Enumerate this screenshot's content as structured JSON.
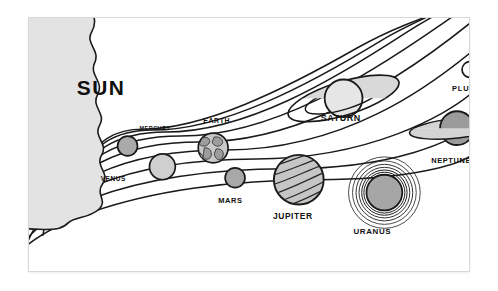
{
  "diagram": {
    "type": "schematic-illustration",
    "style": "black-and-white line art, coloring-book style",
    "frame": {
      "border_color": "#d8d8d8",
      "background_color": "#ffffff",
      "x": 28,
      "y": 17,
      "width": 442,
      "height": 255
    },
    "sun": {
      "label": "SUN",
      "fill_color": "#e3e3e3",
      "outline_color": "#1a1a1a",
      "description": "large partial sun at the left edge with flame-like wavy corona boundary",
      "label_x": 48,
      "label_y": 78,
      "label_font_size": 21
    },
    "orbit_count": 9,
    "orbit_color": "#1a1a1a",
    "bodies": [
      {
        "name": "MERCURY",
        "label": "MERCURY",
        "order": 1,
        "cx": 99,
        "cy": 129,
        "r": 10,
        "fill": "#aaaaaa",
        "label_x": 112,
        "label_y": 113,
        "label_size": 5.5,
        "rings": "none",
        "texture": "plain"
      },
      {
        "name": "VENUS",
        "label": "VENUS",
        "order": 2,
        "cx": 134,
        "cy": 150,
        "r": 13,
        "fill": "#cfcfcf",
        "label_x": 73,
        "label_y": 163,
        "label_size": 6.5,
        "rings": "none",
        "texture": "plain"
      },
      {
        "name": "EARTH",
        "label": "EARTH",
        "order": 3,
        "cx": 185,
        "cy": 131,
        "r": 15,
        "fill": "#c9c9c9",
        "label_x": 176,
        "label_y": 106,
        "label_size": 7,
        "rings": "none",
        "texture": "continents"
      },
      {
        "name": "MARS",
        "label": "MARS",
        "order": 4,
        "cx": 207,
        "cy": 161,
        "r": 10,
        "fill": "#a8a8a8",
        "label_x": 191,
        "label_y": 185,
        "label_size": 7.5,
        "rings": "none",
        "texture": "plain"
      },
      {
        "name": "JUPITER",
        "label": "JUPITER",
        "order": 5,
        "cx": 271,
        "cy": 163,
        "r": 25,
        "fill": "#c6c6c6",
        "label_x": 245,
        "label_y": 202,
        "label_size": 8.5,
        "rings": "none",
        "texture": "diagonal-bands"
      },
      {
        "name": "SATURN",
        "label": "SATURN",
        "order": 6,
        "cx": 316,
        "cy": 81,
        "r": 19,
        "fill": "#e0e0e0",
        "label_x": 293,
        "label_y": 104,
        "label_size": 9,
        "rings": "tilted-ellipse",
        "texture": "plain"
      },
      {
        "name": "URANUS",
        "label": "URANUS",
        "order": 7,
        "cx": 357,
        "cy": 176,
        "r": 18,
        "fill": "#a6a6a6",
        "label_x": 327,
        "label_y": 217,
        "label_size": 8,
        "rings": "concentric-circles",
        "texture": "plain"
      },
      {
        "name": "NEPTUNE",
        "label": "NEPTUNE",
        "order": 8,
        "cx": 430,
        "cy": 111,
        "r": 17,
        "fill": "#9b9b9b",
        "label_x": 405,
        "label_y": 146,
        "label_size": 7.5,
        "rings": "flat-ellipse",
        "texture": "plain"
      },
      {
        "name": "PLUTO",
        "label": "PLUTO",
        "order": 9,
        "cx": 443,
        "cy": 52,
        "r": 8,
        "fill": "#ffffff",
        "label_x": 425,
        "label_y": 74,
        "label_size": 7.5,
        "rings": "none",
        "texture": "plain"
      }
    ]
  }
}
